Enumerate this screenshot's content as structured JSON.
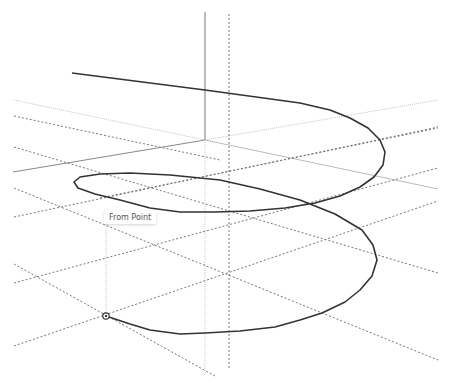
{
  "app": {
    "view": "3D modeling viewport"
  },
  "viewport": {
    "background": "#ffffff",
    "inference_tooltip": "From Point",
    "cursor_icon": "inference-point-icon"
  },
  "colors": {
    "curve": "#333333",
    "axis_solid": "#777777",
    "axis_light": "#bbbbbb",
    "guide_dashed": "#666666",
    "guide_dotted": "#999999"
  },
  "geometry": {
    "helix_start": [
      106,
      316
    ],
    "helix_end": [
      72,
      73
    ],
    "description": "Helix spiral curve with dashed construction guides and axes"
  }
}
